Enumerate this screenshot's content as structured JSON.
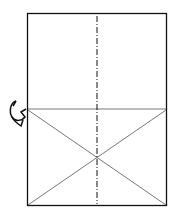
{
  "diagram": {
    "type": "origami-fold-step",
    "caption_fragment": "",
    "paper": {
      "x": 27,
      "y": 13,
      "width": 140,
      "height": 193
    },
    "valley_fold_line": {
      "style": "dash-dot",
      "orientation": "vertical",
      "x": 97
    },
    "crease_horizontal_y": 109,
    "diagonal_creases": [
      {
        "from": [
          28,
          110
        ],
        "to": [
          166,
          205
        ]
      },
      {
        "from": [
          166,
          110
        ],
        "to": [
          28,
          205
        ]
      }
    ],
    "arrow": {
      "icon": "turn-over-arrow-icon",
      "position": "left-edge"
    },
    "colors": {
      "line": "#111111",
      "crease": "#555555",
      "background": "#ffffff"
    }
  }
}
